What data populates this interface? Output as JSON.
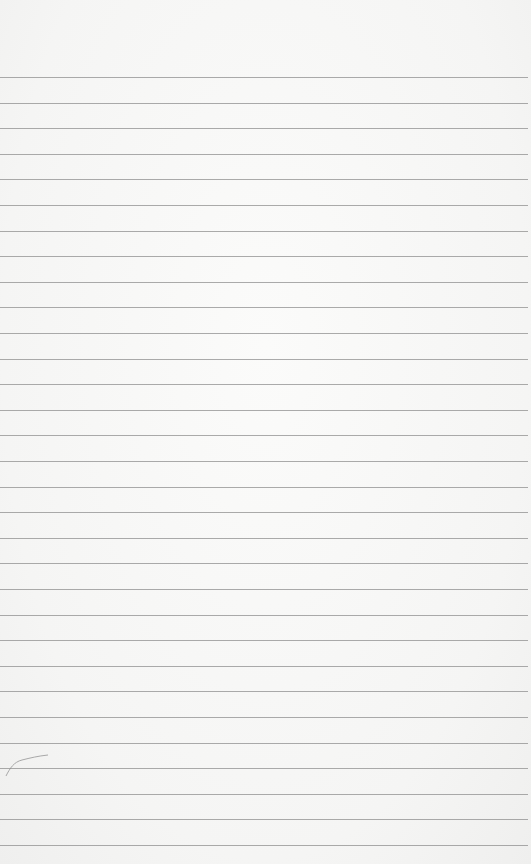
{
  "paper": {
    "type": "lined-notebook-paper",
    "background_color": "#f7f7f6",
    "line_color": "#8f8f8f",
    "first_line_y": 77,
    "line_spacing": 25.6,
    "line_count": 31
  },
  "marks": [
    {
      "type": "pencil-scribble",
      "x": 4,
      "y": 750
    }
  ]
}
